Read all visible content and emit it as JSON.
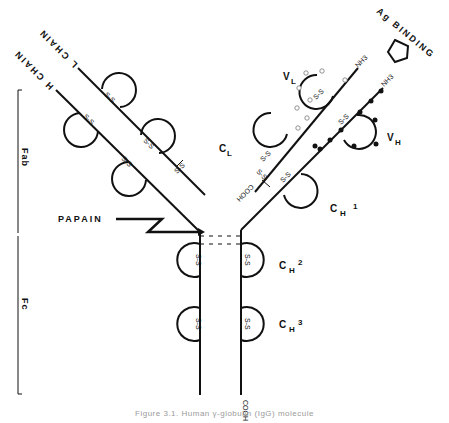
{
  "diagram": {
    "chains": {
      "l_chain": "L CHAIN",
      "h_chain": "H CHAIN"
    },
    "binding_site": "Ag BINDING",
    "enzyme": "PAPAIN",
    "regions": {
      "fab": "Fab",
      "fc": "Fc"
    },
    "domains": {
      "vl": {
        "main": "V",
        "sub": "L"
      },
      "cl": {
        "main": "C",
        "sub": "L"
      },
      "vh": {
        "main": "V",
        "sub": "H"
      },
      "ch1": {
        "main": "C",
        "sub": "H",
        "num": "1"
      },
      "ch2": {
        "main": "C",
        "sub": "H",
        "num": "2"
      },
      "ch3": {
        "main": "C",
        "sub": "H",
        "num": "3"
      }
    },
    "termini": {
      "nh3": "NH3",
      "cooh": "COOH"
    },
    "bond_label": "S-S",
    "caption": "Figure 3.1. Human γ-globulin (IgG) molecule"
  }
}
